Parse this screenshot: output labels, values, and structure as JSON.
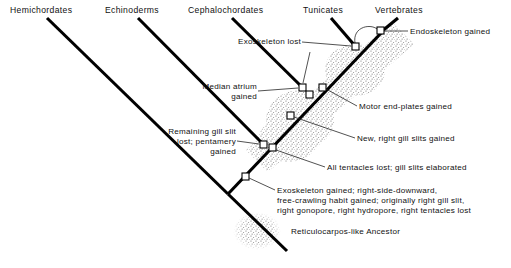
{
  "diagram": {
    "type": "cladogram",
    "title_visible": false,
    "colors": {
      "branch": "#000000",
      "leader": "#262626",
      "text": "#111111",
      "node_fill": "#ffffff",
      "stipple": "#7a7a7a",
      "background": "#ffffff"
    }
  },
  "taxa": [
    {
      "id": "hemichordates",
      "label": "Hemichordates"
    },
    {
      "id": "echinoderms",
      "label": "Echinoderms"
    },
    {
      "id": "cephalochordates",
      "label": "Cephalochordates"
    },
    {
      "id": "tunicates",
      "label": "Tunicates"
    },
    {
      "id": "vertebrates",
      "label": "Vertebrates"
    }
  ],
  "events": [
    {
      "id": "exoskeleton-lost",
      "label": "Exoskeleton lost"
    },
    {
      "id": "endoskeleton-gained",
      "label": "Endoskeleton gained"
    },
    {
      "id": "median-atrium-gained-1",
      "label": "Median atrium"
    },
    {
      "id": "median-atrium-gained-2",
      "label": "gained"
    },
    {
      "id": "motor-end-plates",
      "label": "Motor end-plates gained"
    },
    {
      "id": "remaining-gill-slit-1",
      "label": "Remaining gill slit"
    },
    {
      "id": "remaining-gill-slit-2",
      "label": "lost; pentamery"
    },
    {
      "id": "remaining-gill-slit-3",
      "label": "gained"
    },
    {
      "id": "new-right-gill-slits",
      "label": "New, right gill slits gained"
    },
    {
      "id": "all-tentacles-lost",
      "label": "All tentacles lost; gill slits elaborated"
    },
    {
      "id": "exoskeleton-gained-1",
      "label": "Exoskeleton gained; right-side-downward,"
    },
    {
      "id": "exoskeleton-gained-2",
      "label": "free-crawling habit gained; originally right gill slit,"
    },
    {
      "id": "exoskeleton-gained-3",
      "label": "right  gonopore, right hydropore, right tentacles lost"
    }
  ],
  "ancestor": {
    "id": "reticulocarpos",
    "label": "Reticulocarpos-like Ancestor"
  }
}
